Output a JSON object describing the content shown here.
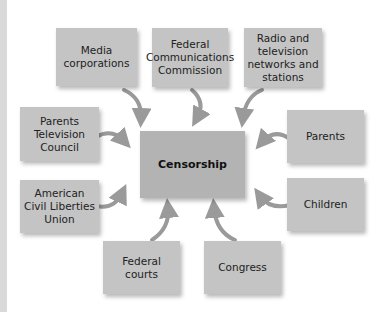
{
  "diagram": {
    "type": "hub-and-spoke",
    "center": {
      "label": "Censorship"
    },
    "nodes": [
      {
        "id": "media",
        "label": "Media corporations",
        "position": "top-left"
      },
      {
        "id": "fcc",
        "label": "Federal Communications Commission",
        "position": "top-center"
      },
      {
        "id": "radio",
        "label": "Radio and television networks and stations",
        "position": "top-right"
      },
      {
        "id": "ptc",
        "label": "Parents Television Council",
        "position": "left-upper"
      },
      {
        "id": "parents",
        "label": "Parents",
        "position": "right-upper"
      },
      {
        "id": "aclu",
        "label": "American Civil Liberties Union",
        "position": "left-lower"
      },
      {
        "id": "children",
        "label": "Children",
        "position": "right-lower"
      },
      {
        "id": "courts",
        "label": "Federal courts",
        "position": "bottom-left"
      },
      {
        "id": "congress",
        "label": "Congress",
        "position": "bottom-right"
      }
    ],
    "edges_direction": "all nodes point toward center",
    "colors": {
      "box": "#c4c4c4",
      "center_box": "#b3b3b3",
      "arrow": "#9a9a9a",
      "left_stripe": "#d9d9d9"
    }
  }
}
